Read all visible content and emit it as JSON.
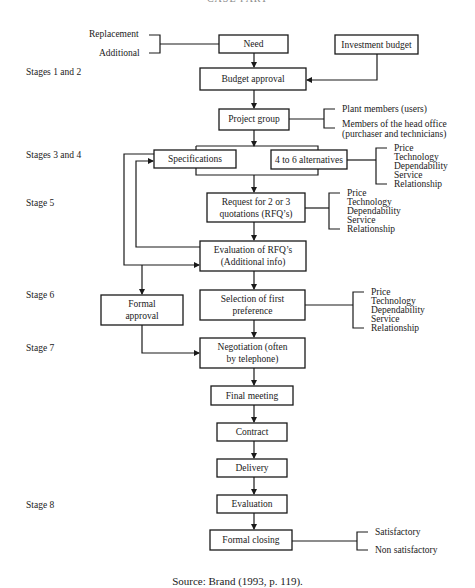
{
  "header": {
    "running_head": "CASE PART"
  },
  "stages": [
    {
      "label": "Stages 1 and 2"
    },
    {
      "label": "Stages 3 and 4"
    },
    {
      "label": "Stage 5"
    },
    {
      "label": "Stage 6"
    },
    {
      "label": "Stage 7"
    },
    {
      "label": "Stage 8"
    }
  ],
  "need_inputs": [
    "Replacement",
    "Additional"
  ],
  "nodes": {
    "need": "Need",
    "investment_budget": "Investment budget",
    "budget_approval": "Budget approval",
    "project_group": "Project group",
    "specifications": "Specifications",
    "alternatives": "4 to 6 alternatives",
    "request_line1": "Request for 2 or 3",
    "request_line2": "quotations (RFQ’s)",
    "evaluation_rfq_line1": "Evaluation of RFQ’s",
    "evaluation_rfq_line2": "(Additional info)",
    "formal_approval_line1": "Formal",
    "formal_approval_line2": "approval",
    "selection_line1": "Selection of first",
    "selection_line2": "preference",
    "negotiation_line1": "Negotiation (often",
    "negotiation_line2": "by telephone)",
    "final_meeting": "Final meeting",
    "contract": "Contract",
    "delivery": "Delivery",
    "evaluation": "Evaluation",
    "formal_closing": "Formal closing"
  },
  "project_group_members": {
    "item1": "Plant members (users)",
    "item2_line1": "Members of the head office",
    "item2_line2": "(purchaser and technicians)"
  },
  "criteria": [
    "Price",
    "Technology",
    "Dependability",
    "Service",
    "Relationship"
  ],
  "closing_outcomes": [
    "Satisfactory",
    "Non satisfactory"
  ],
  "source": "Source: Brand (1993, p. 119)."
}
